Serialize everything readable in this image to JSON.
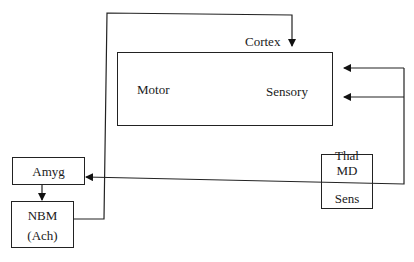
{
  "diagram": {
    "nodes": {
      "cortex": {
        "title": "Cortex",
        "regions": {
          "motor": "Motor",
          "sensory": "Sensory"
        }
      },
      "amyg": {
        "label": "Amyg"
      },
      "nbm": {
        "label": "NBM",
        "sublabel": "(Ach)"
      },
      "thal": {
        "title": "Thal",
        "top": "MD",
        "bottom": "Sens"
      }
    },
    "edges": [
      {
        "from": "amyg",
        "to": "nbm"
      },
      {
        "from": "nbm",
        "to": "cortex"
      },
      {
        "from": "thal",
        "to": "cortex.sensory",
        "count": 2
      },
      {
        "from": "thal",
        "to": "amyg"
      }
    ],
    "colors": {
      "line": "#222222",
      "background": "#ffffff"
    }
  }
}
